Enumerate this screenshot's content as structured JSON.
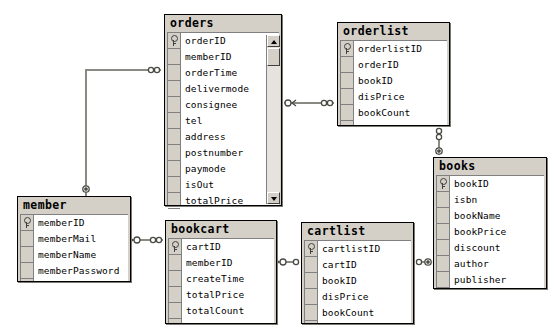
{
  "diagram": {
    "kind": "entity-relationship-diagram",
    "background": "#ffffff",
    "table_header_color": "#d4d0c8",
    "row_background": "#ffffff",
    "border_color": "#000000",
    "line_color": "#808080"
  },
  "tables": [
    {
      "id": "orders",
      "name": "orders",
      "x": 164,
      "y": 14,
      "w": 118,
      "h": 192,
      "has_scrollbar": true,
      "columns": [
        {
          "name": "orderID",
          "pk": true
        },
        {
          "name": "memberID",
          "pk": false
        },
        {
          "name": "orderTime",
          "pk": false
        },
        {
          "name": "delivermode",
          "pk": false
        },
        {
          "name": "consignee",
          "pk": false
        },
        {
          "name": "tel",
          "pk": false
        },
        {
          "name": "address",
          "pk": false
        },
        {
          "name": "postnumber",
          "pk": false
        },
        {
          "name": "paymode",
          "pk": false
        },
        {
          "name": "isOut",
          "pk": false
        },
        {
          "name": "totalPrice",
          "pk": false
        },
        {
          "name": "totalCount",
          "pk": false
        }
      ]
    },
    {
      "id": "orderlist",
      "name": "orderlist",
      "x": 337,
      "y": 22,
      "w": 113,
      "h": 104,
      "has_scrollbar": false,
      "columns": [
        {
          "name": "orderlistID",
          "pk": true
        },
        {
          "name": "orderID",
          "pk": false
        },
        {
          "name": "bookID",
          "pk": false
        },
        {
          "name": "disPrice",
          "pk": false
        },
        {
          "name": "bookCount",
          "pk": false
        }
      ]
    },
    {
      "id": "books",
      "name": "books",
      "x": 433,
      "y": 157,
      "w": 114,
      "h": 132,
      "has_scrollbar": false,
      "columns": [
        {
          "name": "bookID",
          "pk": true
        },
        {
          "name": "isbn",
          "pk": false
        },
        {
          "name": "bookName",
          "pk": false
        },
        {
          "name": "bookPrice",
          "pk": false
        },
        {
          "name": "discount",
          "pk": false
        },
        {
          "name": "author",
          "pk": false
        },
        {
          "name": "publisher",
          "pk": false
        }
      ]
    },
    {
      "id": "member",
      "name": "member",
      "x": 17,
      "y": 196,
      "w": 114,
      "h": 86,
      "has_scrollbar": false,
      "columns": [
        {
          "name": "memberID",
          "pk": true
        },
        {
          "name": "memberMail",
          "pk": false
        },
        {
          "name": "memberName",
          "pk": false
        },
        {
          "name": "memberPassword",
          "pk": false
        }
      ]
    },
    {
      "id": "bookcart",
      "name": "bookcart",
      "x": 165,
      "y": 220,
      "w": 112,
      "h": 104,
      "has_scrollbar": false,
      "columns": [
        {
          "name": "cartID",
          "pk": true
        },
        {
          "name": "memberID",
          "pk": false
        },
        {
          "name": "createTime",
          "pk": false
        },
        {
          "name": "totalPrice",
          "pk": false
        },
        {
          "name": "totalCount",
          "pk": false
        }
      ]
    },
    {
      "id": "cartlist",
      "name": "cartlist",
      "x": 301,
      "y": 222,
      "w": 113,
      "h": 102,
      "has_scrollbar": false,
      "columns": [
        {
          "name": "cartlistID",
          "pk": true
        },
        {
          "name": "cartID",
          "pk": false
        },
        {
          "name": "bookID",
          "pk": false
        },
        {
          "name": "disPrice",
          "pk": false
        },
        {
          "name": "bookCount",
          "pk": false
        }
      ]
    }
  ],
  "relationships": [
    {
      "id": "member-orders",
      "from": "member",
      "to": "orders",
      "from_cardinality": "one",
      "to_cardinality": "many"
    },
    {
      "id": "orders-orderlist",
      "from": "orders",
      "to": "orderlist",
      "from_cardinality": "one",
      "to_cardinality": "many"
    },
    {
      "id": "orderlist-books",
      "from": "orderlist",
      "to": "books",
      "from_cardinality": "many",
      "to_cardinality": "one"
    },
    {
      "id": "member-bookcart",
      "from": "member",
      "to": "bookcart",
      "from_cardinality": "one",
      "to_cardinality": "many"
    },
    {
      "id": "bookcart-cartlist",
      "from": "bookcart",
      "to": "cartlist",
      "from_cardinality": "one",
      "to_cardinality": "many"
    },
    {
      "id": "cartlist-books",
      "from": "cartlist",
      "to": "books",
      "from_cardinality": "many",
      "to_cardinality": "one"
    }
  ],
  "scrollbar": {
    "up_arrow": "scroll-up-arrow",
    "down_arrow": "scroll-down-arrow",
    "thumb_position_pct": 5
  }
}
